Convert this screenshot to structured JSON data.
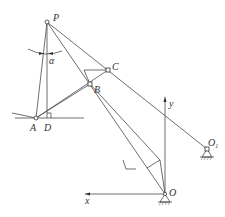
{
  "diagram": {
    "type": "mechanism-linkage",
    "labels": {
      "P": "P",
      "alpha": "α",
      "C": "C",
      "B": "B",
      "A": "A",
      "D": "D",
      "y": "y",
      "x": "x",
      "O": "O",
      "O1": "O",
      "O1_sub": "1"
    },
    "points": {
      "P": [
        47,
        22
      ],
      "A": [
        36,
        118
      ],
      "D": [
        47,
        118
      ],
      "B": [
        90,
        84
      ],
      "C": [
        108,
        70
      ],
      "O": [
        165,
        194
      ],
      "O1": [
        207,
        149
      ]
    },
    "colors": {
      "line": "#4a4a4a",
      "text": "#333333"
    }
  }
}
